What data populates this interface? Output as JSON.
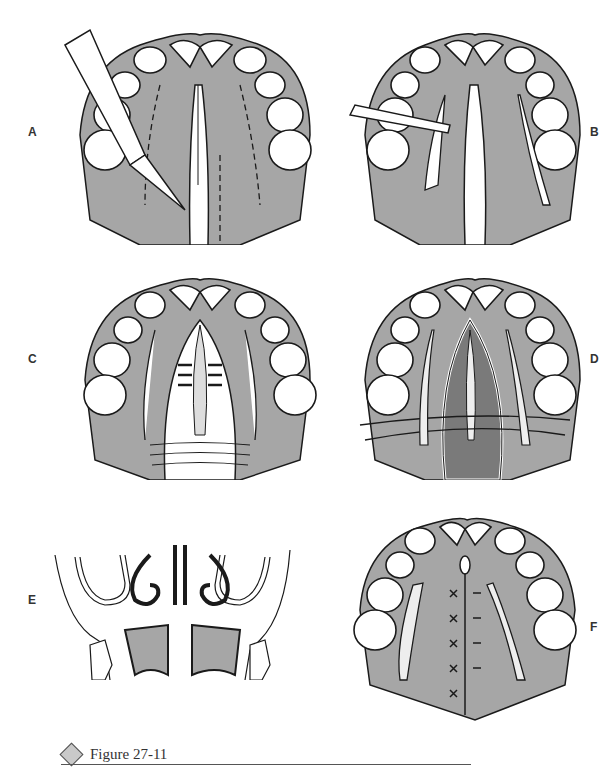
{
  "figure": {
    "title": "Figure 27-11",
    "colors": {
      "palate_fill": "#a6a6a6",
      "dark_fill": "#7a7a7a",
      "line": "#1a1a1a",
      "tooth_fill": "#ffffff",
      "caption_diamond": "#c9c9c9"
    }
  },
  "panels": [
    {
      "label": "A",
      "description": "Palate with midline cleft; scalpel making lateral relaxing incisions (dashed lines)"
    },
    {
      "label": "B",
      "description": "Elevator raising mucoperiosteal flap; lateral relaxing incisions opened"
    },
    {
      "label": "C",
      "description": "Nasal layer sutured; flaps being approximated with sutures"
    },
    {
      "label": "D",
      "description": "Nasal mucosa closed; sutures placed across oral flaps"
    },
    {
      "label": "E",
      "description": "Coronal section showing nasal cavity, turbinates and closed palatal flaps"
    },
    {
      "label": "F",
      "description": "Completed closure with midline sutures; lateral relaxing incisions packed"
    }
  ]
}
